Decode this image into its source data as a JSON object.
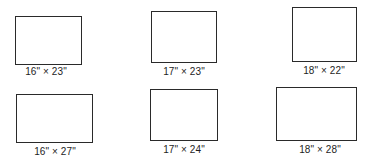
{
  "figure": {
    "stroke_color": "#2a2a2a",
    "frames": [
      {
        "width_in": 16,
        "height_in": 23,
        "label": "16\" × 23\""
      },
      {
        "width_in": 17,
        "height_in": 23,
        "label": "17\" × 23\""
      },
      {
        "width_in": 18,
        "height_in": 22,
        "label": "18\" × 22\""
      },
      {
        "width_in": 16,
        "height_in": 27,
        "label": "16\" × 27\""
      },
      {
        "width_in": 17,
        "height_in": 24,
        "label": "17\" × 24\""
      },
      {
        "width_in": 18,
        "height_in": 28,
        "label": "18\" × 28\""
      }
    ]
  }
}
